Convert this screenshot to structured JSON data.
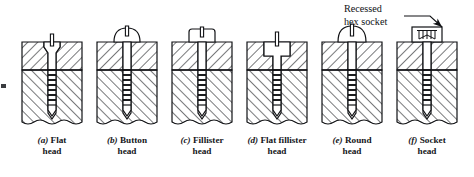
{
  "figure": {
    "background_color": "#ffffff",
    "line_color": "#101114",
    "hatch_color": "#15161a",
    "annotation": {
      "name": "recessed-hex-socket-callout",
      "line1": "Recessed",
      "line2": "hex socket",
      "leader": "line-with-arrowhead",
      "points_to": "socket-head-screw"
    },
    "edge_mark": {
      "name": "left-edge-artifact",
      "visible": true
    },
    "break_line": "wavy-break-line-bottom",
    "parting_line": "dash-dot-centerline-between-members",
    "screws": [
      {
        "id": "a",
        "index_label": "(a)",
        "name_line1": "Flat",
        "name_line2": "head",
        "head_style": "flat-countersunk",
        "drive": "slot",
        "head_above_surface": false,
        "x": 22
      },
      {
        "id": "b",
        "index_label": "(b)",
        "name_line1": "Button",
        "name_line2": "head",
        "head_style": "button-dome",
        "drive": "slot",
        "head_above_surface": true,
        "x": 97
      },
      {
        "id": "c",
        "index_label": "(c)",
        "name_line1": "Fillister",
        "name_line2": "head",
        "head_style": "fillister-cylindrical",
        "drive": "slot",
        "head_above_surface": true,
        "x": 172
      },
      {
        "id": "d",
        "index_label": "(d)",
        "name_line1": "Flat fillister",
        "name_line2": "head",
        "head_style": "fillister-counterbored-flush",
        "drive": "slot",
        "head_above_surface": false,
        "x": 247
      },
      {
        "id": "e",
        "index_label": "(e)",
        "name_line1": "Round",
        "name_line2": "head",
        "head_style": "round-dome",
        "drive": "slot",
        "head_above_surface": true,
        "x": 322
      },
      {
        "id": "f",
        "index_label": "(f)",
        "name_line1": "Socket",
        "name_line2": "head",
        "head_style": "socket-cylindrical",
        "drive": "recessed-hex-socket",
        "head_above_surface": true,
        "x": 397
      }
    ]
  }
}
